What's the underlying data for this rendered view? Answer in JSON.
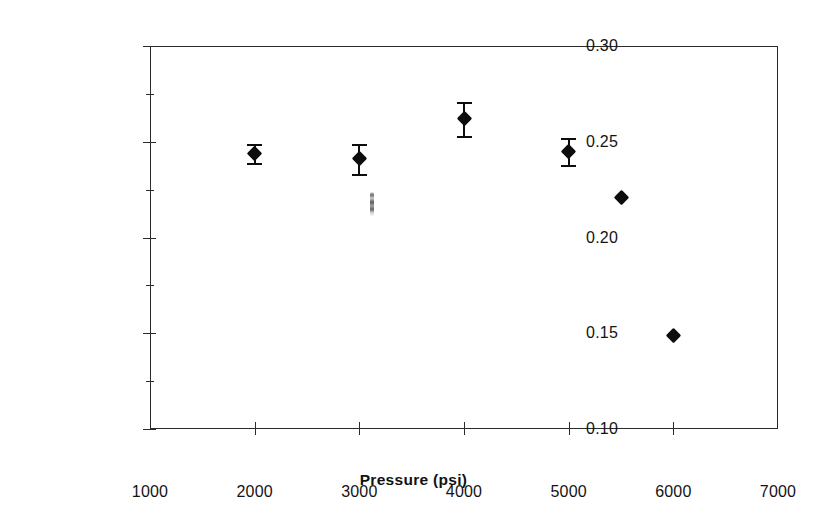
{
  "chart_data": {
    "type": "scatter",
    "title": "",
    "xlabel": "Pressure (psi)",
    "ylabel": "Foam Bulk Density (g/cm",
    "ylabel_superscript": "3",
    "ylabel_suffix": ")",
    "x": [
      2000,
      3000,
      4000,
      5000,
      5500,
      6000
    ],
    "values": [
      0.244,
      0.241,
      0.262,
      0.245,
      0.221,
      0.149
    ],
    "yerr": [
      0.005,
      0.008,
      0.009,
      0.007,
      0.0,
      0.0
    ],
    "series": [
      {
        "name": "Foam Bulk Density",
        "points": [
          {
            "x": 2000,
            "y": 0.244,
            "yerr": 0.005,
            "has_errorbar": true
          },
          {
            "x": 3000,
            "y": 0.241,
            "yerr": 0.008,
            "has_errorbar": true
          },
          {
            "x": 4000,
            "y": 0.262,
            "yerr": 0.009,
            "has_errorbar": true
          },
          {
            "x": 5000,
            "y": 0.245,
            "yerr": 0.007,
            "has_errorbar": true
          },
          {
            "x": 5500,
            "y": 0.221,
            "yerr": 0.0,
            "has_errorbar": false
          },
          {
            "x": 6000,
            "y": 0.149,
            "yerr": 0.0,
            "has_errorbar": false
          }
        ]
      }
    ],
    "xlim": [
      1000,
      7000
    ],
    "ylim": [
      0.1,
      0.3
    ],
    "xticks": [
      1000,
      2000,
      3000,
      4000,
      5000,
      6000,
      7000
    ],
    "xtick_labels": [
      "1000",
      "2000",
      "3000",
      "4000",
      "5000",
      "6000",
      "7000"
    ],
    "yticks": [
      0.1,
      0.15,
      0.2,
      0.25,
      0.3
    ],
    "ytick_labels": [
      "0.10",
      "0.15",
      "0.20",
      "0.25",
      "0.30"
    ],
    "yticks_minor": [
      0.125,
      0.175,
      0.225,
      0.275
    ],
    "grid": false,
    "legend": null,
    "marker": "diamond",
    "marker_color": "#0d0d0d",
    "frame_color": "#2b2b2b",
    "background_color": "#ffffff",
    "artifacts": [
      {
        "name": "scan-smudge",
        "x": 3120,
        "y": 0.2175
      }
    ]
  },
  "axes": {
    "x_title": "Pressure (psi)",
    "y_title_main": "Foam Bulk Density (g/cm",
    "y_title_sup": "3",
    "y_title_end": ")"
  }
}
